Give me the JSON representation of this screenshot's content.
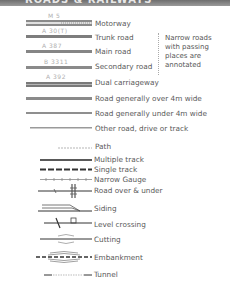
{
  "header": {
    "title": "ROADS & RAILWAYS"
  },
  "roads": [
    {
      "id": "motorway",
      "number": "M 5",
      "label": "Motorway"
    },
    {
      "id": "trunk",
      "number": "A 30(T)",
      "label": "Trunk road"
    },
    {
      "id": "main",
      "number": "A 387",
      "label": "Main road"
    },
    {
      "id": "secondary",
      "number": "B 3311",
      "label": "Secondary road"
    },
    {
      "id": "dual",
      "number": "A 392",
      "label": "Dual carriageway"
    },
    {
      "id": "over4m",
      "label": "Road generally over 4m wide"
    },
    {
      "id": "under4m",
      "label": "Road generally under 4m wide"
    },
    {
      "id": "other",
      "label": "Other road, drive or track"
    },
    {
      "id": "path",
      "label": "Path"
    }
  ],
  "note": "Narrow roads with passing places are annotated",
  "railways": [
    {
      "id": "multiple",
      "label": "Multiple track"
    },
    {
      "id": "single",
      "label": "Single track"
    },
    {
      "id": "narrow",
      "label": "Narrow Gauge"
    },
    {
      "id": "roadover",
      "label": "Road over & under"
    },
    {
      "id": "siding",
      "label": "Siding"
    },
    {
      "id": "levelcrossing",
      "label": "Level crossing"
    },
    {
      "id": "cutting",
      "label": "Cutting"
    },
    {
      "id": "embankment",
      "label": "Embankment"
    },
    {
      "id": "tunnel",
      "label": "Tunnel"
    }
  ],
  "colors": {
    "header": "#7a7a7a",
    "road_line": "#7d7d7d",
    "road_number": "#b0b0b0",
    "rail_line": "#333333",
    "text": "#5a5a5a"
  }
}
